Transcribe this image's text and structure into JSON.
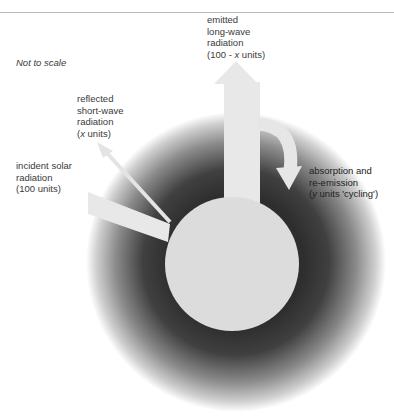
{
  "figure": {
    "note": "Not to scale",
    "colors": {
      "planet": "#dcdcdc",
      "atmosphere_dark": "#3a3a3a",
      "atmosphere_light": "#ffffff",
      "arrow": "#e6e6e6",
      "rule": "#bcbcbc"
    },
    "labels": {
      "emitted": {
        "line1": "emitted",
        "line2": "long-wave",
        "line3": "radiation",
        "line4_pre": "(100 - ",
        "line4_var": "x",
        "line4_post": " units)"
      },
      "reflected": {
        "line1": "reflected",
        "line2": "short-wave",
        "line3": "radiation",
        "line4_pre": "(",
        "line4_var": "x",
        "line4_post": " units)"
      },
      "incident": {
        "line1": "incident solar",
        "line2": "radiation",
        "line3": "(100 units)"
      },
      "absorption": {
        "line1": "absorption and",
        "line2": "re-emission",
        "line3_pre": "(",
        "line3_var": "y",
        "line3_post": " units 'cycling')"
      }
    }
  }
}
